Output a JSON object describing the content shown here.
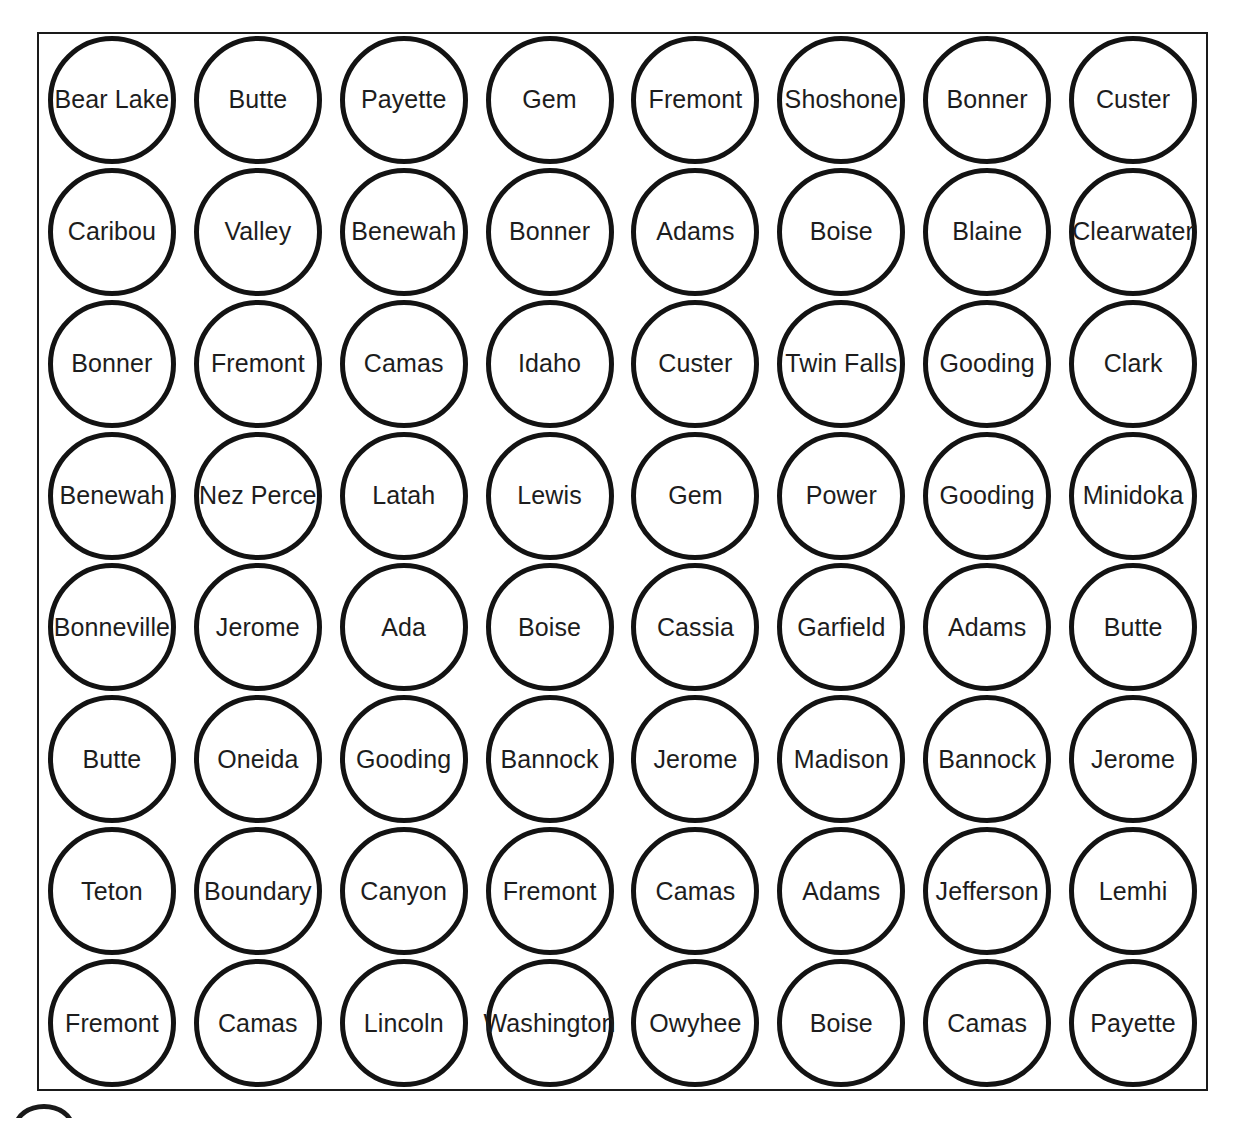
{
  "document": {
    "title": "County Name Circles Worksheet",
    "background_color": "#ffffff",
    "frame_color": "#1a1a1a",
    "circle_stroke_color": "#131313",
    "text_color": "#1d1d1d"
  },
  "grid": {
    "rows": 8,
    "columns": 8,
    "total_circles": 64,
    "shape": "circle",
    "cells": [
      [
        {
          "label": "Bear Lake"
        },
        {
          "label": "Butte"
        },
        {
          "label": "Payette"
        },
        {
          "label": "Gem"
        },
        {
          "label": "Fremont"
        },
        {
          "label": "Shoshone"
        },
        {
          "label": "Bonner"
        },
        {
          "label": "Custer"
        }
      ],
      [
        {
          "label": "Caribou"
        },
        {
          "label": "Valley"
        },
        {
          "label": "Benewah"
        },
        {
          "label": "Bonner"
        },
        {
          "label": "Adams"
        },
        {
          "label": "Boise"
        },
        {
          "label": "Blaine"
        },
        {
          "label": "Clearwater"
        }
      ],
      [
        {
          "label": "Bonner"
        },
        {
          "label": "Fremont"
        },
        {
          "label": "Camas"
        },
        {
          "label": "Idaho"
        },
        {
          "label": "Custer"
        },
        {
          "label": "Twin Falls"
        },
        {
          "label": "Gooding"
        },
        {
          "label": "Clark"
        }
      ],
      [
        {
          "label": "Benewah"
        },
        {
          "label": "Nez Perce"
        },
        {
          "label": "Latah"
        },
        {
          "label": "Lewis"
        },
        {
          "label": "Gem"
        },
        {
          "label": "Power"
        },
        {
          "label": "Gooding"
        },
        {
          "label": "Minidoka"
        }
      ],
      [
        {
          "label": "Bonneville"
        },
        {
          "label": "Jerome"
        },
        {
          "label": "Ada"
        },
        {
          "label": "Boise"
        },
        {
          "label": "Cassia"
        },
        {
          "label": "Garfield"
        },
        {
          "label": "Adams"
        },
        {
          "label": "Butte"
        }
      ],
      [
        {
          "label": "Butte"
        },
        {
          "label": "Oneida"
        },
        {
          "label": "Gooding"
        },
        {
          "label": "Bannock"
        },
        {
          "label": "Jerome"
        },
        {
          "label": "Madison"
        },
        {
          "label": "Bannock"
        },
        {
          "label": "Jerome"
        }
      ],
      [
        {
          "label": "Teton"
        },
        {
          "label": "Boundary"
        },
        {
          "label": "Canyon"
        },
        {
          "label": "Fremont"
        },
        {
          "label": "Camas"
        },
        {
          "label": "Adams"
        },
        {
          "label": "Jefferson"
        },
        {
          "label": "Lemhi"
        }
      ],
      [
        {
          "label": "Fremont"
        },
        {
          "label": "Camas"
        },
        {
          "label": "Lincoln"
        },
        {
          "label": "Washington"
        },
        {
          "label": "Owyhee"
        },
        {
          "label": "Boise"
        },
        {
          "label": "Camas"
        },
        {
          "label": "Payette"
        }
      ]
    ]
  }
}
